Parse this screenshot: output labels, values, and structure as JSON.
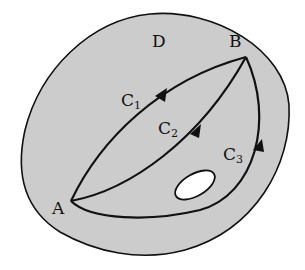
{
  "diagram": {
    "region_label": "D",
    "start_point": "A",
    "end_point": "B",
    "curves": [
      {
        "name": "C",
        "sub": "1"
      },
      {
        "name": "C",
        "sub": "2"
      },
      {
        "name": "C",
        "sub": "3"
      }
    ],
    "colors": {
      "region_fill": "#cccccc",
      "stroke": "#111111",
      "hole_fill": "#ffffff"
    }
  }
}
